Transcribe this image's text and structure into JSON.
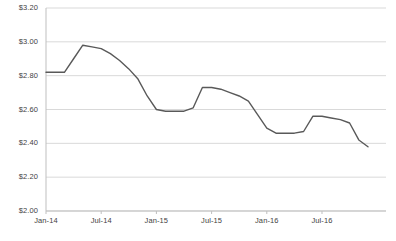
{
  "chart_data": {
    "type": "line",
    "title": "",
    "subtitle": "",
    "xlabel": "",
    "ylabel": "",
    "ylim": [
      2.0,
      3.2
    ],
    "ytick_step": 0.2,
    "ytick_labels": [
      "$3.20",
      "$3.00",
      "$2.80",
      "$2.60",
      "$2.40",
      "$2.20",
      "$2.00"
    ],
    "ytick_values": [
      3.2,
      3.0,
      2.8,
      2.6,
      2.4,
      2.2,
      2.0
    ],
    "xtick_labels": [
      "Jan-14",
      "Jul-14",
      "Jan-15",
      "Jul-15",
      "Jan-16",
      "Jul-16"
    ],
    "xtick_x": [
      "Jan-14",
      "Jul-14",
      "Jan-15",
      "Jul-15",
      "Jan-16",
      "Jul-16"
    ],
    "grid": true,
    "grid_axis": "y",
    "legend": false,
    "legend_position": "none",
    "line_color": "#595959",
    "grid_color": "#d9d9d9",
    "axis_color": "#bfbfbf",
    "background": "#ffffff",
    "x": [
      "Jan-14",
      "Feb-14",
      "Mar-14",
      "Apr-14",
      "May-14",
      "Jun-14",
      "Jul-14",
      "Aug-14",
      "Sep-14",
      "Oct-14",
      "Nov-14",
      "Dec-14",
      "Jan-15",
      "Feb-15",
      "Mar-15",
      "Apr-15",
      "May-15",
      "Jun-15",
      "Jul-15",
      "Aug-15",
      "Sep-15",
      "Oct-15",
      "Nov-15",
      "Dec-15",
      "Jan-16",
      "Feb-16",
      "Mar-16",
      "Apr-16",
      "May-16",
      "Jun-16",
      "Jul-16",
      "Aug-16",
      "Sep-16",
      "Oct-16",
      "Nov-16",
      "Dec-16"
    ],
    "values": [
      2.82,
      2.82,
      2.82,
      2.9,
      2.98,
      2.97,
      2.96,
      2.93,
      2.89,
      2.84,
      2.78,
      2.68,
      2.6,
      2.59,
      2.59,
      2.59,
      2.61,
      2.73,
      2.73,
      2.72,
      2.7,
      2.68,
      2.65,
      2.57,
      2.49,
      2.46,
      2.46,
      2.46,
      2.47,
      2.56,
      2.56,
      2.55,
      2.54,
      2.52,
      2.42,
      2.38
    ],
    "series": [
      {
        "name": "Price",
        "values": [
          2.82,
          2.82,
          2.82,
          2.9,
          2.98,
          2.97,
          2.96,
          2.93,
          2.89,
          2.84,
          2.78,
          2.68,
          2.6,
          2.59,
          2.59,
          2.59,
          2.61,
          2.73,
          2.73,
          2.72,
          2.7,
          2.68,
          2.65,
          2.57,
          2.49,
          2.46,
          2.46,
          2.46,
          2.47,
          2.56,
          2.56,
          2.55,
          2.54,
          2.52,
          2.42,
          2.38
        ]
      }
    ]
  }
}
